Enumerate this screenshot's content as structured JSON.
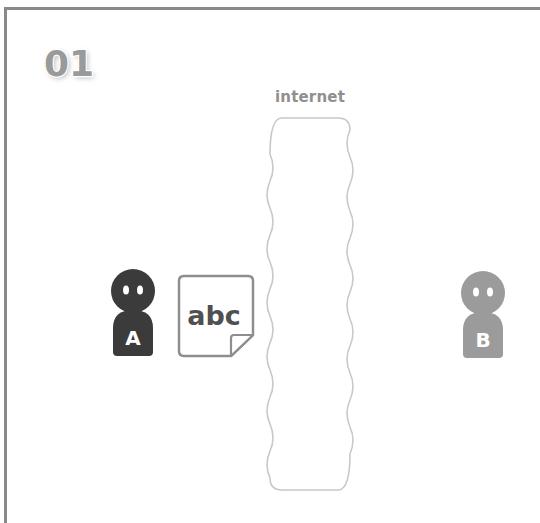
{
  "step": {
    "number": "01"
  },
  "network": {
    "label": "internet"
  },
  "people": [
    {
      "id": "A",
      "label": "A",
      "color": "#3b3b3b"
    },
    {
      "id": "B",
      "label": "B",
      "color": "#9b9b9b"
    }
  ],
  "document": {
    "text": "abc"
  },
  "colors": {
    "frame": "#8a8a8a",
    "cloud_outline": "#c8c8c8",
    "doc_outline": "#8e8e8e",
    "doc_text": "#505050",
    "label_text": "#8f8f8f"
  }
}
